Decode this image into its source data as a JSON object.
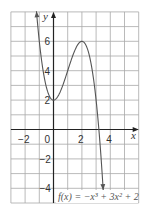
{
  "chart_data": {
    "type": "line",
    "title": "",
    "function_label": "f(x) = −x³ + 3x² + 2",
    "xlabel": "x",
    "ylabel": "y",
    "xlim": [
      -3,
      6
    ],
    "ylim": [
      -5,
      8
    ],
    "grid": true,
    "x_ticks": [
      {
        "value": -2,
        "label": "−2"
      },
      {
        "value": 0,
        "label": "0"
      },
      {
        "value": 2,
        "label": "2"
      },
      {
        "value": 4,
        "label": "4"
      }
    ],
    "y_ticks": [
      {
        "value": 6,
        "label": "6"
      },
      {
        "value": 4,
        "label": "4"
      },
      {
        "value": 2,
        "label": "2"
      },
      {
        "value": -2,
        "label": "−2"
      },
      {
        "value": -4,
        "label": "−4"
      }
    ],
    "series": [
      {
        "name": "f(x) = −x³ + 3x² + 2",
        "x_range": [
          -1.2,
          3.5
        ],
        "key_points": [
          {
            "x": -1.2,
            "y": 8.05
          },
          {
            "x": -1,
            "y": 6
          },
          {
            "x": 0,
            "y": 2
          },
          {
            "x": 1,
            "y": 4
          },
          {
            "x": 2,
            "y": 6
          },
          {
            "x": 3,
            "y": 2
          },
          {
            "x": 3.5,
            "y": -4.125
          }
        ],
        "arrows_at_ends": true
      }
    ]
  }
}
